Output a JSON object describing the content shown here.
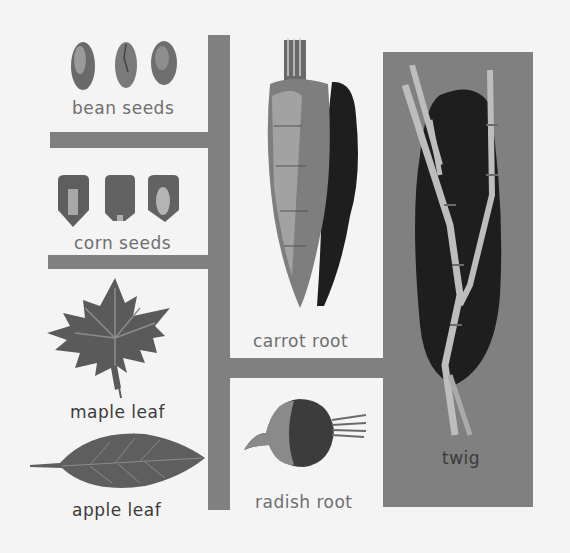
{
  "colors": {
    "background": "#f4f4f4",
    "panel_gray": "#808080",
    "label_gray": "#6e6e6e",
    "shadow_black": "#1e1e1e"
  },
  "items": [
    {
      "id": "bean-seeds",
      "label": "bean seeds"
    },
    {
      "id": "corn-seeds",
      "label": "corn seeds"
    },
    {
      "id": "maple-leaf",
      "label": "maple leaf"
    },
    {
      "id": "apple-leaf",
      "label": "apple leaf"
    },
    {
      "id": "carrot-root",
      "label": "carrot root"
    },
    {
      "id": "radish-root",
      "label": "radish root"
    },
    {
      "id": "twig",
      "label": "twig"
    }
  ]
}
